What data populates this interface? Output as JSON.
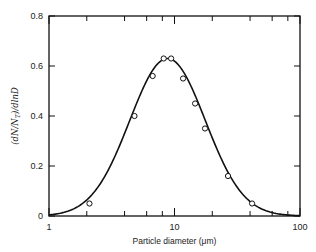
{
  "chart_data": {
    "type": "line",
    "title": "",
    "xlabel": "Particle diameter (μm)",
    "ylabel": "(dN/N_T)/dlnD",
    "xscale": "log",
    "xlim": [
      1,
      100
    ],
    "ylim": [
      0,
      0.8
    ],
    "grid": false,
    "legend": null,
    "x_ticks": [
      1,
      10,
      100
    ],
    "x_tick_labels": [
      "1",
      "10",
      "100"
    ],
    "x_minor_ticks": [
      2,
      4,
      6,
      8,
      20,
      40,
      60,
      80
    ],
    "y_ticks": [
      0,
      0.2,
      0.4,
      0.6,
      0.8
    ],
    "y_tick_labels": [
      "0",
      "0.2",
      "0.4",
      "0.6",
      "0.8"
    ],
    "series": [
      {
        "name": "measured",
        "style": "open-circle markers",
        "x": [
          2.1,
          4.8,
          6.7,
          8.2,
          9.4,
          11.7,
          14.6,
          17.5,
          26.7,
          41.5
        ],
        "y": [
          0.05,
          0.4,
          0.56,
          0.63,
          0.63,
          0.55,
          0.45,
          0.35,
          0.16,
          0.05
        ]
      },
      {
        "name": "lognormal fit",
        "style": "solid line",
        "median_diameter": 8.8,
        "geometric_std": 2.0,
        "peak": 0.63
      }
    ]
  },
  "labels": {
    "x_axis_title": "Particle diameter (μm)",
    "y_axis_title": "(dN/N",
    "y_axis_sub": "T",
    "y_axis_tail": ")/dlnD"
  }
}
